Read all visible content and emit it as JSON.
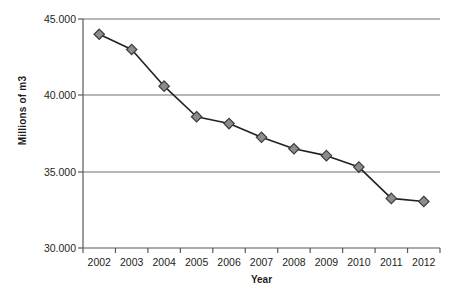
{
  "chart_data": {
    "type": "line",
    "title": "",
    "xlabel": "Year",
    "ylabel": "Millions of m3",
    "categories": [
      "2002",
      "2003",
      "2004",
      "2005",
      "2006",
      "2007",
      "2008",
      "2009",
      "2010",
      "2011",
      "2012"
    ],
    "values": [
      44.0,
      43.0,
      40.6,
      38.6,
      38.15,
      37.25,
      36.5,
      36.05,
      35.3,
      33.25,
      33.05
    ],
    "series": [
      {
        "name": "Millions of m3",
        "values": [
          44.0,
          43.0,
          40.6,
          38.6,
          38.15,
          37.25,
          36.5,
          36.05,
          35.3,
          33.25,
          33.05
        ]
      }
    ],
    "ylim": [
      30.0,
      45.0
    ],
    "y_ticks": [
      45.0,
      40.0,
      35.0,
      30.0
    ],
    "y_tick_labels": [
      "45.000",
      "40.000",
      "35.000",
      "30.000"
    ],
    "grid": "horizontal",
    "legend": "none",
    "marker": "diamond",
    "marker_color": "#8c8c8c",
    "marker_edge_color": "#3b3b3b",
    "line_color": "#231f20",
    "gridline_color": "#808080",
    "axis_color": "#595959"
  },
  "axes": {
    "y_title": "Millions of m3",
    "x_title": "Year"
  }
}
